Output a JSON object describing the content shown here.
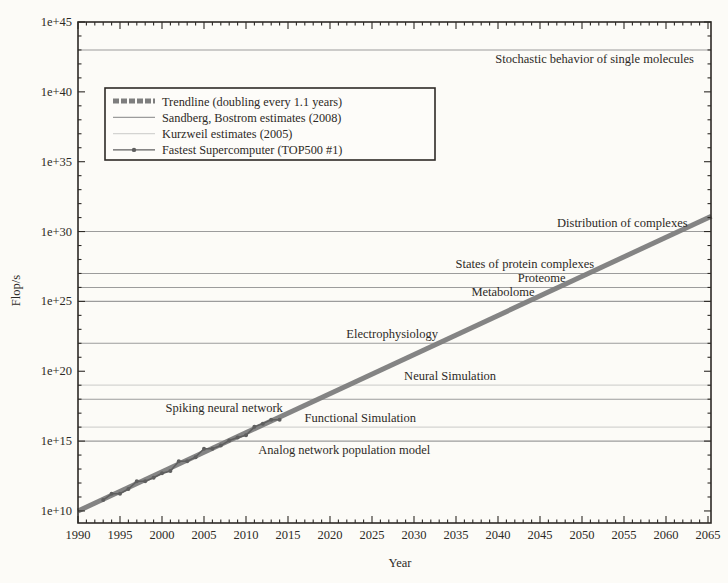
{
  "axes": {
    "x_label": "Year",
    "y_label": "Flop/s",
    "x_tick_labels": [
      "1990",
      "1995",
      "2000",
      "2005",
      "2010",
      "2015",
      "2020",
      "2025",
      "2030",
      "2035",
      "2040",
      "2045",
      "2050",
      "2055",
      "2060",
      "2065"
    ],
    "y_tick_labels": [
      "1e+10",
      "1e+15",
      "1e+20",
      "1e+25",
      "1e+30",
      "1e+35",
      "1e+40",
      "1e+45"
    ]
  },
  "legend": {
    "items": [
      {
        "label": "Trendline (doubling every 1.1 years)",
        "style": "trendline"
      },
      {
        "label": "Sandberg, Bostrom estimates (2008)",
        "style": "sb-line"
      },
      {
        "label": "Kurzweil estimates (2005)",
        "style": "kurzweil-line"
      },
      {
        "label": "Fastest Supercomputer (TOP500 #1)",
        "style": "marker-line"
      }
    ]
  },
  "chart_data": {
    "type": "line",
    "title": "",
    "xlabel": "Year",
    "ylabel": "Flop/s",
    "x_range": [
      1990,
      2065.4
    ],
    "y_log10_range": [
      9.1,
      45
    ],
    "x_major_ticks": [
      1990,
      1995,
      2000,
      2005,
      2010,
      2015,
      2020,
      2025,
      2030,
      2035,
      2040,
      2045,
      2050,
      2055,
      2060,
      2065
    ],
    "y_major_tick_log10": [
      10,
      15,
      20,
      25,
      30,
      35,
      40,
      45
    ],
    "grid": "horizontal reference lines only",
    "legend_position": "upper-left",
    "trendline": {
      "name": "Trendline (doubling every 1.1 years)",
      "doubling_time_years": 1.1,
      "x": [
        1990,
        2065.4
      ],
      "log10_flops": [
        10,
        31.1
      ]
    },
    "supercomputers": {
      "name": "Fastest Supercomputer (TOP500 #1)",
      "points_year_log10flops": [
        [
          1993,
          10.78
        ],
        [
          1994,
          11.23
        ],
        [
          1995,
          11.23
        ],
        [
          1996,
          11.57
        ],
        [
          1997,
          12.13
        ],
        [
          1998,
          12.13
        ],
        [
          1999,
          12.38
        ],
        [
          2000,
          12.69
        ],
        [
          2001,
          12.86
        ],
        [
          2002,
          13.56
        ],
        [
          2003,
          13.56
        ],
        [
          2004,
          13.85
        ],
        [
          2005,
          14.45
        ],
        [
          2006,
          14.45
        ],
        [
          2007,
          14.68
        ],
        [
          2008,
          15.04
        ],
        [
          2009,
          15.25
        ],
        [
          2010,
          15.41
        ],
        [
          2011,
          16.02
        ],
        [
          2012,
          16.25
        ],
        [
          2013,
          16.53
        ],
        [
          2014,
          16.53
        ]
      ]
    },
    "reference_levels": {
      "sandberg_bostrom_2008": [
        {
          "label": "Analog network population model",
          "log10_flops": 15,
          "label_year": 2021.7,
          "label_side": "below"
        },
        {
          "label": "Spiking neural network",
          "log10_flops": 18,
          "label_year": 2007.4,
          "label_side": "below"
        },
        {
          "label": "Electrophysiology",
          "log10_flops": 22,
          "label_year": 2027.4,
          "label_side": "above"
        },
        {
          "label": "Metabolome",
          "log10_flops": 25,
          "label_year": 2040.6,
          "label_side": "above"
        },
        {
          "label": "Proteome",
          "log10_flops": 26,
          "label_year": 2045.2,
          "label_side": "above"
        },
        {
          "label": "States of protein complexes",
          "log10_flops": 27,
          "label_year": 2043.2,
          "label_side": "above"
        },
        {
          "label": "Distribution of complexes",
          "log10_flops": 30,
          "label_year": 2054.8,
          "label_side": "above"
        },
        {
          "label": "Stochastic behavior of single molecules",
          "log10_flops": 43,
          "label_year": 2051.5,
          "label_side": "below"
        }
      ],
      "kurzweil_2005": [
        {
          "label": "Functional Simulation",
          "log10_flops": 16,
          "label_year": 2023.6,
          "label_side": "above"
        },
        {
          "label": "Neural Simulation",
          "log10_flops": 19,
          "label_year": 2034.3,
          "label_side": "above"
        }
      ]
    }
  },
  "style": {
    "page_background": "#fcfbf7",
    "ink_color": "#2d2a26",
    "trendline_color": "#7e7e7e",
    "sandberg_bostrom_line_color": "#9c9c9c",
    "kurzweil_line_color": "#d4d4d2",
    "supercomputer_color": "#5f5f5f",
    "legend_fill": "#fdfcf9"
  }
}
